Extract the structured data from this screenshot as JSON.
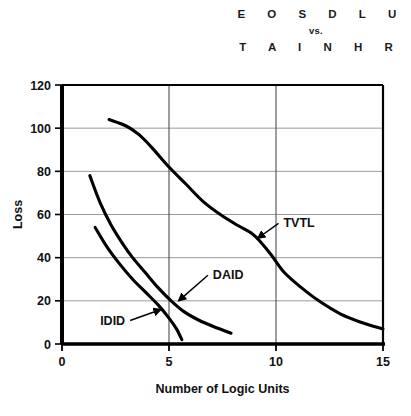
{
  "title": {
    "line1": "E O S D L U",
    "separator": "vs.",
    "line2": "T A I N H R"
  },
  "caption": "",
  "chart_data": {
    "type": "line",
    "xlabel": "Number of Logic Units",
    "ylabel": "Loss",
    "xlim": [
      0,
      15
    ],
    "ylim": [
      0,
      120
    ],
    "xticks": [
      0,
      5,
      10,
      15
    ],
    "yticks": [
      0,
      20,
      40,
      60,
      80,
      100,
      120
    ],
    "xtick_labels": [
      "0",
      "5",
      "10",
      "15"
    ],
    "ytick_labels": [
      "0",
      "20",
      "40",
      "60",
      "80",
      "100",
      "120"
    ],
    "grid": true,
    "grid_x": [
      5,
      10
    ],
    "grid_y": [
      20,
      40,
      60,
      80,
      100
    ],
    "legend": "annotations",
    "legend_position": "inline-callouts",
    "series": [
      {
        "name": "TVTL",
        "label": "TVTL",
        "color": "#000000",
        "points": [
          [
            2.2,
            104
          ],
          [
            3.0,
            101
          ],
          [
            3.6,
            97
          ],
          [
            4.2,
            91
          ],
          [
            5.0,
            82
          ],
          [
            5.8,
            74
          ],
          [
            6.6,
            66
          ],
          [
            7.4,
            60
          ],
          [
            8.2,
            55
          ],
          [
            8.9,
            51
          ],
          [
            9.3,
            47
          ],
          [
            9.8,
            41
          ],
          [
            10.4,
            33
          ],
          [
            11.2,
            26
          ],
          [
            12.0,
            20
          ],
          [
            13.0,
            14
          ],
          [
            14.0,
            10
          ],
          [
            15.0,
            7
          ]
        ],
        "annotation": {
          "text": "TVTL",
          "label_x": 10.35,
          "label_y": 54,
          "arrow_to_x": 9.15,
          "arrow_to_y": 49
        }
      },
      {
        "name": "DAID",
        "label": "DAID",
        "color": "#000000",
        "points": [
          [
            1.3,
            78
          ],
          [
            1.8,
            65
          ],
          [
            2.3,
            55
          ],
          [
            2.8,
            47
          ],
          [
            3.3,
            40
          ],
          [
            3.9,
            33
          ],
          [
            4.5,
            26
          ],
          [
            5.1,
            20
          ],
          [
            5.7,
            15
          ],
          [
            6.4,
            11
          ],
          [
            7.1,
            8
          ],
          [
            7.9,
            5
          ]
        ],
        "annotation": {
          "text": "DAID",
          "label_x": 7.05,
          "label_y": 30,
          "arrow_to_x": 5.45,
          "arrow_to_y": 20
        }
      },
      {
        "name": "IDID",
        "label": "IDID",
        "color": "#000000",
        "points": [
          [
            1.55,
            54
          ],
          [
            2.1,
            45
          ],
          [
            2.7,
            37
          ],
          [
            3.3,
            30
          ],
          [
            3.9,
            24
          ],
          [
            4.5,
            18
          ],
          [
            5.0,
            12
          ],
          [
            5.35,
            7
          ],
          [
            5.6,
            2
          ]
        ],
        "annotation": {
          "text": "IDID",
          "label_x": 2.95,
          "label_y": 9,
          "arrow_to_x": 4.62,
          "arrow_to_y": 16
        }
      }
    ]
  }
}
